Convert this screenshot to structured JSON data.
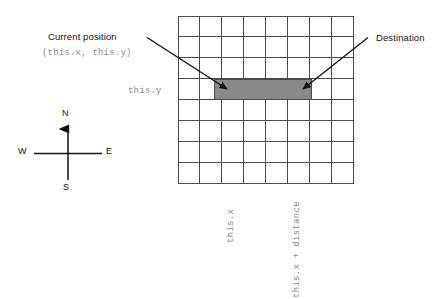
{
  "diagram": {
    "title_text_present": false,
    "annotations": {
      "current_position_label": "Current position",
      "current_position_coords": "(this.x, this.y)",
      "destination_label": "Destination"
    },
    "axis_labels": {
      "y_label": "this.y",
      "x_label": "this.x",
      "x_end_label": "this.x + distance"
    },
    "compass": {
      "north": "N",
      "south": "S",
      "west": "W",
      "east": "E"
    },
    "grid": {
      "columns": 8,
      "rows": 8,
      "line_color": "#4a4a4a"
    },
    "path_band": {
      "fill_color": "#8a8a8a",
      "start_column": 1.6,
      "end_column": 6.1,
      "row": 3,
      "description": "shaded horizontal band from current position to destination"
    },
    "arrows": {
      "current_position_arrow": "points down-right to left edge of shaded band",
      "destination_arrow": "points down-left to right edge of shaded band",
      "color": "#111111"
    },
    "colors": {
      "background": "#ffffff",
      "text": "#141414",
      "mono_text": "#8c8c8c",
      "grid_line": "#4a4a4a",
      "band_fill": "#8a8a8a"
    }
  }
}
